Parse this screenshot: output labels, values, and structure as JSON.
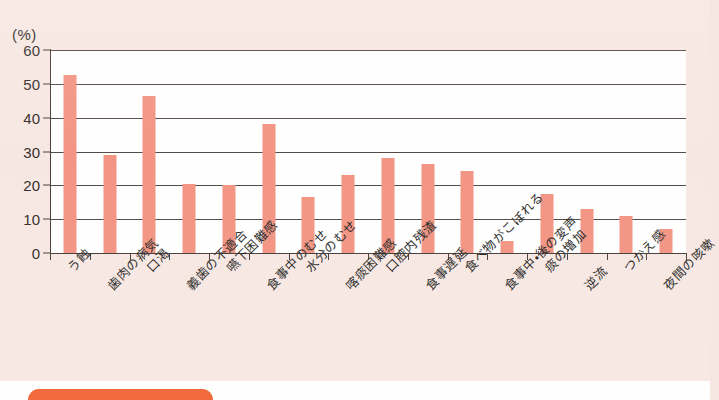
{
  "figure": {
    "unit_label": "(%)",
    "background_color": "#f7e7e2",
    "plot_background_color": "#ffffff",
    "bar_color": "#f2907f",
    "axis_color": "#3d3634"
  },
  "caption": {
    "badge_color": "#ef5a28",
    "badge_label": "",
    "text": ""
  },
  "chart_data": {
    "type": "bar",
    "title": "",
    "xlabel": "",
    "ylabel": "(%)",
    "ylim": [
      0,
      60
    ],
    "ytick_values": [
      0,
      10,
      20,
      30,
      40,
      50,
      60
    ],
    "ytick_labels": [
      "0",
      "10",
      "20",
      "30",
      "40",
      "50",
      "60"
    ],
    "grid": true,
    "legend": false,
    "orientation": "vertical",
    "categories": [
      "う蝕",
      "歯肉の病気",
      "口渇",
      "義歯の不適合",
      "嚥下困難感",
      "食事中のむせ",
      "水分のむせ",
      "喀痰困難感",
      "口腔内残渣",
      "食事遅延",
      "食べ物がこぼれる",
      "食事中・後の変声",
      "痰の増加",
      "逆流",
      "つかえ感",
      "夜間の咳嗽"
    ],
    "values": [
      52.5,
      29.0,
      46.5,
      20.3,
      20.2,
      38.0,
      16.5,
      23.0,
      28.2,
      26.3,
      24.2,
      3.5,
      17.5,
      13.0,
      11.0,
      7.0
    ]
  }
}
